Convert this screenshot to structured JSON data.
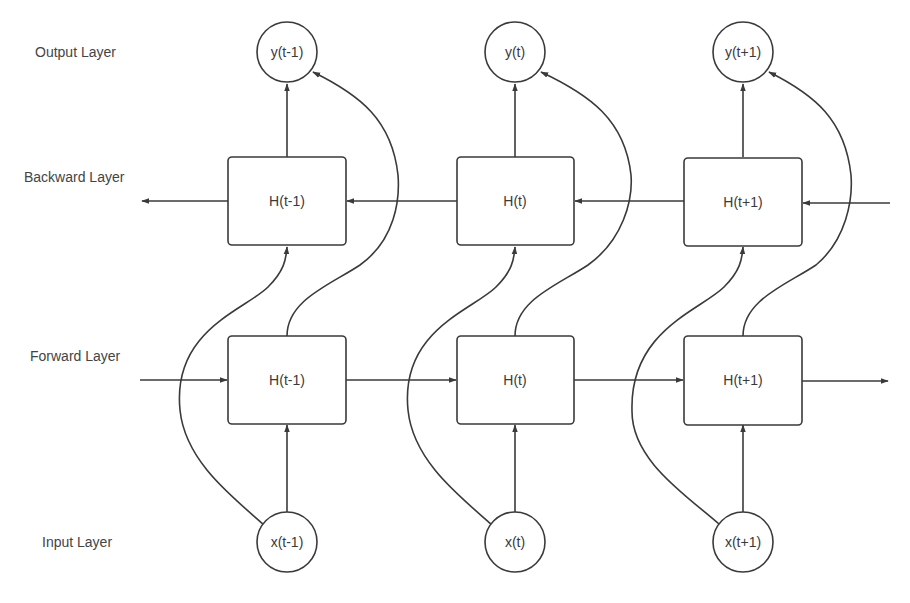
{
  "layers": {
    "output": "Output Layer",
    "backward": "Backward Layer",
    "forward": "Forward Layer",
    "input": "Input Layer"
  },
  "columns": [
    {
      "output": "y(t-1)",
      "backward": "H(t-1)",
      "forward": "H(t-1)",
      "input": "x(t-1)"
    },
    {
      "output": "y(t)",
      "backward": "H(t)",
      "forward": "H(t)",
      "input": "x(t)"
    },
    {
      "output": "y(t+1)",
      "backward": "H(t+1)",
      "forward": "H(t+1)",
      "input": "x(t+1)"
    }
  ],
  "colors": {
    "stroke": "#3a3a3a",
    "background": "#ffffff"
  }
}
